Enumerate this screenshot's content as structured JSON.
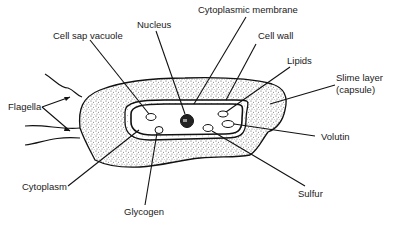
{
  "diagram": {
    "colors": {
      "ink": "#111111",
      "stipple": "#777777",
      "background": "#ffffff"
    },
    "labels": [
      {
        "id": "nucleus",
        "text": "Nucleus"
      },
      {
        "id": "cytoplasmic-membrane",
        "text": "Cytoplasmic membrane"
      },
      {
        "id": "cell-sap-vacuole",
        "text": "Cell sap vacuole"
      },
      {
        "id": "cell-wall",
        "text": "Cell wall"
      },
      {
        "id": "lipids",
        "text": "Lipids"
      },
      {
        "id": "slime-layer",
        "text": "Slime layer"
      },
      {
        "id": "slime-layer-note",
        "text": "(capsule)"
      },
      {
        "id": "flagella",
        "text": "Flagella"
      },
      {
        "id": "volutin",
        "text": "Volutin"
      },
      {
        "id": "cytoplasm",
        "text": "Cytoplasm"
      },
      {
        "id": "sulfur",
        "text": "Sulfur"
      },
      {
        "id": "glycogen",
        "text": "Glycogen"
      }
    ]
  }
}
